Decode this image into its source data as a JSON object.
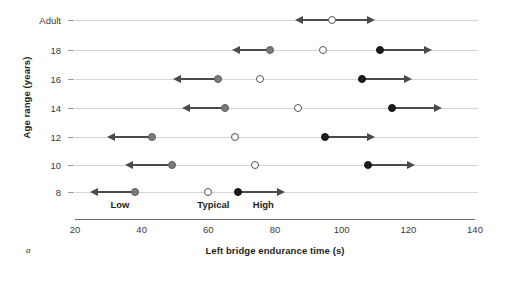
{
  "chart_data": {
    "type": "scatter",
    "title": "",
    "panel_letter": "a",
    "xlabel": "Left bridge endurance time (s)",
    "ylabel": "Age range (years)",
    "xlim": [
      20,
      140
    ],
    "xticks": [
      20,
      40,
      60,
      80,
      100,
      120,
      140
    ],
    "xtick_labels": [
      "20",
      "40",
      "60",
      "80",
      "100",
      "120",
      "140"
    ],
    "categories": [
      "Adult",
      "18",
      "16",
      "14",
      "12",
      "10",
      "8"
    ],
    "grid": true,
    "legend": "none",
    "zone_labels": [
      {
        "text": "Low",
        "x": 33.5
      },
      {
        "text": "Typical",
        "x": 61.5
      },
      {
        "text": "High",
        "x": 76.5
      }
    ],
    "series": [
      {
        "name": "Low",
        "marker": "filled-gray",
        "values": [
          null,
          78.5,
          63.0,
          65.0,
          43.0,
          49.0,
          38.0
        ]
      },
      {
        "name": "Typical",
        "marker": "open",
        "values": [
          97.0,
          94.5,
          75.5,
          87.0,
          68.0,
          74.0,
          60.0
        ]
      },
      {
        "name": "High",
        "marker": "filled-black",
        "values": [
          null,
          111.5,
          106.0,
          115.0,
          95.0,
          108.0,
          69.0
        ]
      }
    ],
    "rows": [
      {
        "category": "Adult",
        "points": [
          {
            "series": "Typical",
            "value": 97.0,
            "arrow": "both",
            "arrow_left_to": 86.0,
            "arrow_right_to": 110.0
          }
        ]
      },
      {
        "category": "18",
        "points": [
          {
            "series": "Low",
            "value": 78.5,
            "arrow": "left",
            "arrow_left_to": 67.0
          },
          {
            "series": "Typical",
            "value": 94.5,
            "arrow": "none"
          },
          {
            "series": "High",
            "value": 111.5,
            "arrow": "right",
            "arrow_right_to": 127.0
          }
        ]
      },
      {
        "category": "16",
        "points": [
          {
            "series": "Low",
            "value": 63.0,
            "arrow": "left",
            "arrow_left_to": 49.5
          },
          {
            "series": "Typical",
            "value": 75.5,
            "arrow": "none"
          },
          {
            "series": "High",
            "value": 106.0,
            "arrow": "right",
            "arrow_right_to": 121.0
          }
        ]
      },
      {
        "category": "14",
        "points": [
          {
            "series": "Low",
            "value": 65.0,
            "arrow": "left",
            "arrow_left_to": 52.0
          },
          {
            "series": "Typical",
            "value": 87.0,
            "arrow": "none"
          },
          {
            "series": "High",
            "value": 115.0,
            "arrow": "right",
            "arrow_right_to": 130.0
          }
        ]
      },
      {
        "category": "12",
        "points": [
          {
            "series": "Low",
            "value": 43.0,
            "arrow": "left",
            "arrow_left_to": 29.5
          },
          {
            "series": "Typical",
            "value": 68.0,
            "arrow": "none"
          },
          {
            "series": "High",
            "value": 95.0,
            "arrow": "right",
            "arrow_right_to": 110.0
          }
        ]
      },
      {
        "category": "10",
        "points": [
          {
            "series": "Low",
            "value": 49.0,
            "arrow": "left",
            "arrow_left_to": 35.0
          },
          {
            "series": "Typical",
            "value": 74.0,
            "arrow": "none"
          },
          {
            "series": "High",
            "value": 108.0,
            "arrow": "right",
            "arrow_right_to": 122.0
          }
        ]
      },
      {
        "category": "8",
        "points": [
          {
            "series": "Low",
            "value": 38.0,
            "arrow": "left",
            "arrow_left_to": 24.5
          },
          {
            "series": "Typical",
            "value": 60.0,
            "arrow": "none"
          },
          {
            "series": "High",
            "value": 69.0,
            "arrow": "right",
            "arrow_right_to": 83.0
          }
        ]
      }
    ],
    "colors": {
      "low_marker": "#7b7b7b",
      "high_marker": "#1c1c1c",
      "typical_marker": "#ffffff",
      "gridline": "#d4d4d4",
      "axis": "#6e6e6e",
      "arrow": "#4a4a4a"
    }
  }
}
